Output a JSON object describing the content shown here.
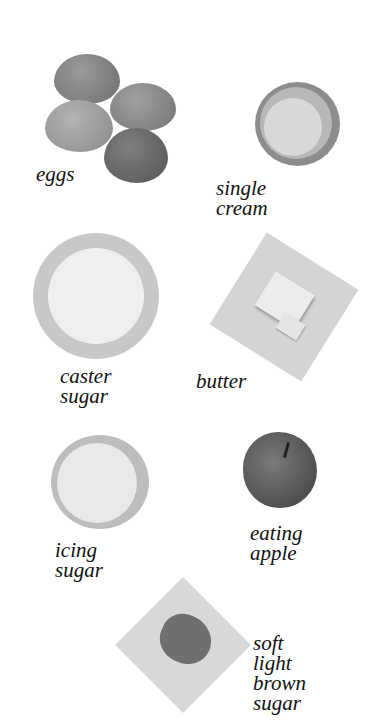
{
  "page": {
    "ingredients": [
      {
        "id": "eggs",
        "label": "eggs"
      },
      {
        "id": "single-cream",
        "label": "single cream"
      },
      {
        "id": "caster-sugar",
        "label": "caster\nsugar"
      },
      {
        "id": "butter",
        "label": "butter"
      },
      {
        "id": "icing-sugar",
        "label": "icing sugar"
      },
      {
        "id": "eating-apple",
        "label": "eating\napple"
      },
      {
        "id": "soft-light-brown-sugar",
        "label": "soft light\nbrown\nsugar"
      }
    ]
  }
}
